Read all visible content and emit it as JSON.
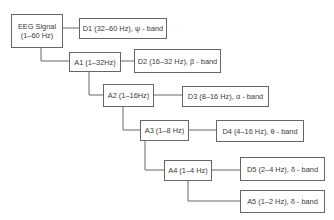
{
  "diagram": {
    "type": "wavelet-decomposition-tree",
    "colors": {
      "line": "#666666",
      "text": "#3a3a3a",
      "background": "#ffffff"
    },
    "root": {
      "id": "eeg",
      "line1": "EEG Signal",
      "line2": "(1–60 Hz)"
    },
    "nodes": [
      {
        "id": "d1",
        "label": "D1 (32–60 Hz), ψ - band"
      },
      {
        "id": "a1",
        "label": "A1 (1–32Hz)"
      },
      {
        "id": "d2",
        "label": "D2 (16–32 Hz), β - band"
      },
      {
        "id": "a2",
        "label": "A2 (1–16Hz)"
      },
      {
        "id": "d3",
        "label": "D3 (8–16 Hz), α - band"
      },
      {
        "id": "a3",
        "label": "A3 (1–8 Hz)"
      },
      {
        "id": "d4",
        "label": "D4 (4–16 Hz), θ - band"
      },
      {
        "id": "a4",
        "label": "A4 (1–4 Hz)"
      },
      {
        "id": "d5",
        "label": "D5 (2–4 Hz), δ - band"
      },
      {
        "id": "a5",
        "label": "A5 (1–2 Hz), δ - band"
      }
    ],
    "edges": [
      [
        "eeg",
        "d1"
      ],
      [
        "eeg",
        "a1"
      ],
      [
        "a1",
        "d2"
      ],
      [
        "a1",
        "a2"
      ],
      [
        "a2",
        "d3"
      ],
      [
        "a2",
        "a3"
      ],
      [
        "a3",
        "d4"
      ],
      [
        "a3",
        "a4"
      ],
      [
        "a4",
        "d5"
      ],
      [
        "a4",
        "a5"
      ]
    ]
  }
}
